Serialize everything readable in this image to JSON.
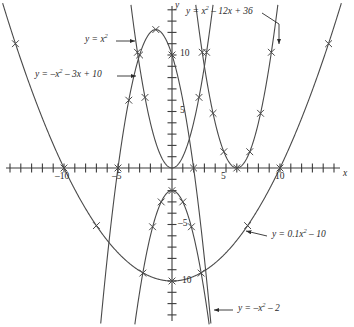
{
  "figure": {
    "background_color": "#ffffff",
    "curve_color": "#4a4a4a",
    "axis_color": "#3c3c3c",
    "text_color": "#2b2b2b"
  },
  "axes": {
    "x_label": "x",
    "y_label": "y",
    "x_range": [
      -16,
      16
    ],
    "y_range": [
      -14,
      14
    ],
    "x_tick_labels": [
      {
        "value": -10,
        "text": "–10"
      },
      {
        "value": -5,
        "text": "–5"
      },
      {
        "value": 5,
        "text": "5"
      },
      {
        "value": 10,
        "text": "10"
      }
    ],
    "y_tick_labels": [
      {
        "value": 10,
        "text": "10"
      },
      {
        "value": 5,
        "text": "5"
      },
      {
        "value": -5,
        "text": "–5"
      },
      {
        "value": -10,
        "text": "10"
      }
    ],
    "tick_interval": 1,
    "grid": false
  },
  "callouts": [
    {
      "id": "label-x-squared",
      "text": "y = x²",
      "arrow": "right"
    },
    {
      "id": "label-neg-x-squared-3x-10",
      "text": "y = –x² – 3x + 10",
      "arrow": "right"
    },
    {
      "id": "label-x-squared-12x-36",
      "text": "y = x² – 12x + 36",
      "arrow": "down-right"
    },
    {
      "id": "label-point-one-x-squared-10",
      "text": "y = 0.1x² – 10",
      "arrow": "left"
    },
    {
      "id": "label-neg-x-squared-2",
      "text": "y = –x² – 2",
      "arrow": "left"
    }
  ],
  "chart_data": {
    "type": "line",
    "title": "",
    "xlabel": "x",
    "ylabel": "y",
    "xlim": [
      -16,
      16
    ],
    "ylim": [
      -14,
      14
    ],
    "grid": false,
    "legend": "callout-labels",
    "marker": "x",
    "series": [
      {
        "name": "y = x²",
        "expression": "y = x^2",
        "coefficients": {
          "a": 1,
          "b": 0,
          "c": 0
        },
        "vertex": [
          0,
          0
        ],
        "marker_points": [
          [
            -3.2,
            10.24
          ],
          [
            -2.5,
            6.25
          ],
          [
            2.5,
            6.25
          ],
          [
            3.2,
            10.24
          ]
        ]
      },
      {
        "name": "y = –x² – 3x + 10",
        "expression": "y = -x^2 - 3x + 10",
        "coefficients": {
          "a": -1,
          "b": -3,
          "c": 10
        },
        "vertex": [
          -1.5,
          12.25
        ],
        "marker_points": [
          [
            -5,
            0
          ],
          [
            -4,
            6
          ],
          [
            -3,
            10
          ],
          [
            -1.5,
            12.25
          ],
          [
            0,
            10
          ],
          [
            2,
            0
          ]
        ]
      },
      {
        "name": "y = x² – 12x + 36",
        "expression": "y = x^2 - 12x + 36",
        "coefficients": {
          "a": 1,
          "b": -12,
          "c": 36
        },
        "vertex": [
          6,
          0
        ],
        "marker_points": [
          [
            2.8,
            10.24
          ],
          [
            3.8,
            4.84
          ],
          [
            4.8,
            1.44
          ],
          [
            6,
            0
          ],
          [
            7.2,
            1.44
          ],
          [
            8.2,
            4.84
          ],
          [
            9.2,
            10.24
          ]
        ]
      },
      {
        "name": "y = 0.1x² – 10",
        "expression": "y = 0.1x^2 - 10",
        "coefficients": {
          "a": 0.1,
          "b": 0,
          "c": -10
        },
        "vertex": [
          0,
          -10
        ],
        "marker_points": [
          [
            -14.5,
            11.0
          ],
          [
            -10,
            0
          ],
          [
            -7,
            -5.1
          ],
          [
            0,
            -10
          ],
          [
            7,
            -5.1
          ],
          [
            10,
            0
          ],
          [
            14.5,
            11.0
          ]
        ]
      },
      {
        "name": "y = –x² – 2",
        "expression": "y = -x^2 - 2",
        "coefficients": {
          "a": -1,
          "b": 0,
          "c": -2
        },
        "vertex": [
          0,
          -2
        ],
        "marker_points": [
          [
            -2.7,
            -9.3
          ],
          [
            -1.8,
            -5.2
          ],
          [
            -1,
            -3
          ],
          [
            0,
            -2
          ],
          [
            1,
            -3
          ],
          [
            1.8,
            -5.2
          ],
          [
            2.7,
            -9.3
          ]
        ]
      }
    ]
  }
}
